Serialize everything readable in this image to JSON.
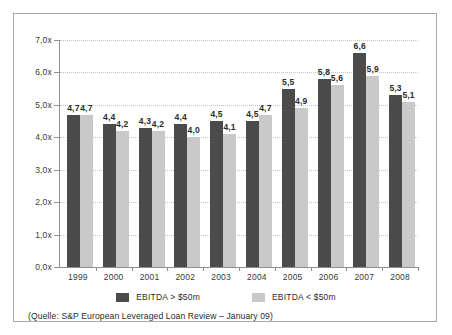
{
  "chart_data": {
    "type": "bar",
    "title": "",
    "xlabel": "",
    "ylabel": "",
    "categories": [
      "1999",
      "2000",
      "2001",
      "2002",
      "2003",
      "2004",
      "2005",
      "2006",
      "2007",
      "2008"
    ],
    "series": [
      {
        "name": "EBITDA > $50m",
        "color": "#4b4b4b",
        "values": [
          4.7,
          4.4,
          4.3,
          4.4,
          4.5,
          4.5,
          5.5,
          5.8,
          6.6,
          5.3
        ],
        "labels": [
          "4,7",
          "4,4",
          "4,3",
          "4,4",
          "4,5",
          "4,5",
          "5,5",
          "5,8",
          "6,6",
          "5,3"
        ]
      },
      {
        "name": "EBITDA < $50m",
        "color": "#c9c9c9",
        "values": [
          4.7,
          4.2,
          4.2,
          4.0,
          4.1,
          4.7,
          4.9,
          5.6,
          5.9,
          5.1
        ],
        "labels": [
          "4,7",
          "4,2",
          "4,2",
          "4,0",
          "4,1",
          "4,7",
          "4,9",
          "5,6",
          "5,9",
          "5,1"
        ]
      }
    ],
    "ylim": [
      0,
      7
    ],
    "ytick_values": [
      0,
      1,
      2,
      3,
      4,
      5,
      6,
      7
    ],
    "ytick_labels": [
      "0,0x",
      "1,0x",
      "2,0x",
      "3,0x",
      "4,0x",
      "5,0x",
      "6,0x",
      "7,0x"
    ],
    "grid": true,
    "legend_position": "bottom"
  },
  "legend": {
    "items": [
      {
        "label": "EBITDA > $50m",
        "swatch": "large"
      },
      {
        "label": "EBITDA < $50m",
        "swatch": "small"
      }
    ]
  },
  "source": {
    "text": "(Quelle: S&P European Leveraged Loan Review – January 09)"
  }
}
